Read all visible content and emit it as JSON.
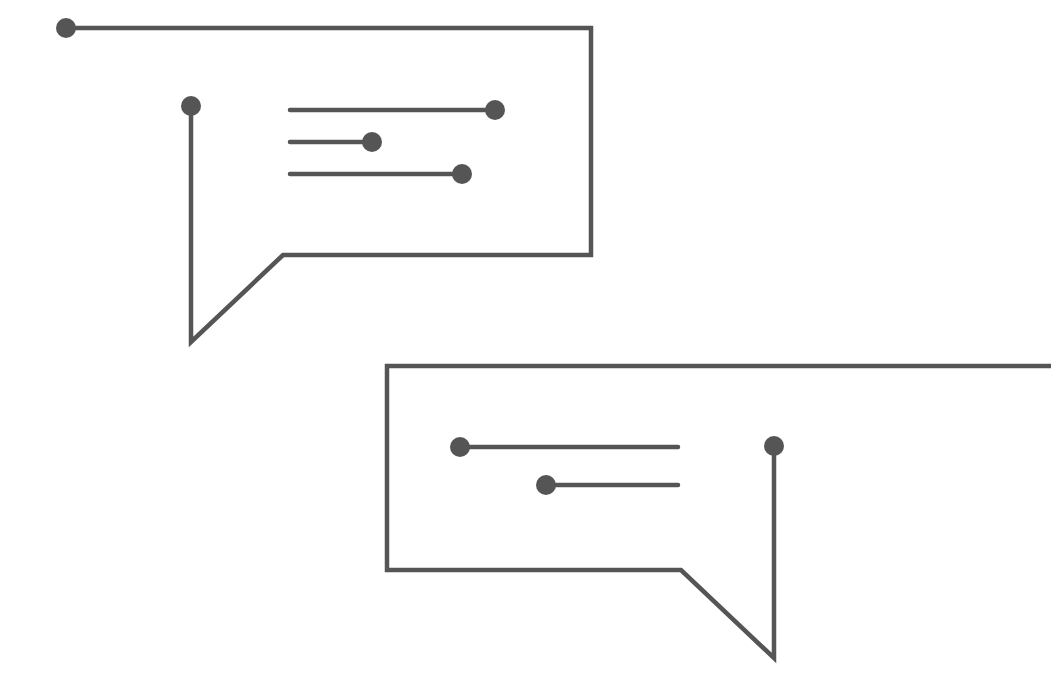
{
  "illustration": {
    "title": "Circuit-style chat bubbles",
    "background": "#ffffff",
    "stroke_color": "#555555",
    "dot_color": "#555555",
    "stroke_width": 4.5,
    "dot_radius": 10,
    "bubbles": [
      {
        "name": "bubble-top-left",
        "outline_points": "66,28 591,28 591,255 283,255 191,342 191,106",
        "outline_start_dot": [
          66,
          28
        ],
        "outline_end_dot": [
          191,
          106
        ],
        "lines": [
          {
            "x1": 290,
            "y1": 110,
            "x2": 495,
            "y2": 110,
            "dot": [
              495,
              110
            ]
          },
          {
            "x1": 290,
            "y1": 142,
            "x2": 372,
            "y2": 142,
            "dot": [
              372,
              142
            ]
          },
          {
            "x1": 290,
            "y1": 174,
            "x2": 462,
            "y2": 174,
            "dot": [
              462,
              174
            ]
          }
        ]
      },
      {
        "name": "bubble-bottom-right",
        "outline_points": "1051,366 387,366 387,570 681,570 774,658 774,446",
        "outline_end_dot": [
          774,
          446
        ],
        "lines": [
          {
            "x1": 460,
            "y1": 447,
            "x2": 678,
            "y2": 447,
            "dot": [
              460,
              447
            ]
          },
          {
            "x1": 546,
            "y1": 485,
            "x2": 678,
            "y2": 485,
            "dot": [
              546,
              485
            ]
          }
        ]
      }
    ]
  }
}
